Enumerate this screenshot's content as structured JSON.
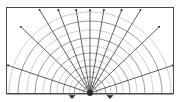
{
  "figure": {
    "type": "diagram",
    "width": 180,
    "height": 102,
    "background_color": "#ffffff"
  },
  "frame": {
    "name": "plot-frame",
    "x": 6,
    "y": 7,
    "width": 168,
    "height": 87,
    "stroke_color": "#4a4a4a",
    "stroke_width": 1,
    "fill": "#ffffff"
  },
  "source": {
    "label": "point-source",
    "x": 90,
    "y": 93,
    "marker_color": "#2b2b2b",
    "marker_size": 3
  },
  "rays": {
    "color": "#3a3a3a",
    "stroke_width": 0.8,
    "arrowhead_color": "#2b2b2b",
    "arrowhead_size": 3.2,
    "count": 11,
    "angles_deg": [
      8,
      24,
      40,
      56,
      72,
      90,
      108,
      124,
      140,
      156,
      172
    ],
    "endpoints": [
      {
        "x": 174,
        "y": 65
      },
      {
        "x": 160,
        "y": 26
      },
      {
        "x": 141,
        "y": 9
      },
      {
        "x": 122,
        "y": 9
      },
      {
        "x": 104,
        "y": 9
      },
      {
        "x": 90,
        "y": 9
      },
      {
        "x": 76,
        "y": 9
      },
      {
        "x": 58,
        "y": 9
      },
      {
        "x": 39,
        "y": 9
      },
      {
        "x": 20,
        "y": 26
      },
      {
        "x": 7,
        "y": 65
      }
    ]
  },
  "wavefronts": {
    "solid_color": "#6e6e6e",
    "dotted_color": "#9a9a9a",
    "stroke_width": 0.7,
    "dash_pattern": "0.9 1.6",
    "center_x": 90,
    "center_y": 93,
    "radii": [
      7,
      11,
      16,
      21,
      27,
      33,
      40,
      47,
      55,
      63,
      72,
      81
    ],
    "styles": [
      "solid",
      "dotted",
      "solid",
      "dotted",
      "solid",
      "dotted",
      "solid",
      "dotted",
      "solid",
      "dotted",
      "solid",
      "dotted"
    ]
  },
  "receivers": [
    {
      "name": "receiver-left",
      "x": 72,
      "y": 94,
      "symbol": "triangle"
    },
    {
      "name": "receiver-right",
      "x": 110,
      "y": 94,
      "symbol": "triangle"
    }
  ],
  "baseline": {
    "name": "ground-surface-line",
    "x1": 6,
    "x2": 174,
    "y": 94,
    "color": "#4a4a4a"
  },
  "legend": {
    "solid_label": "wavefront (crest)",
    "dotted_label": "wavefront (trough)",
    "ray_label": "raypath",
    "source_label": "source",
    "receiver_label": "receiver"
  }
}
